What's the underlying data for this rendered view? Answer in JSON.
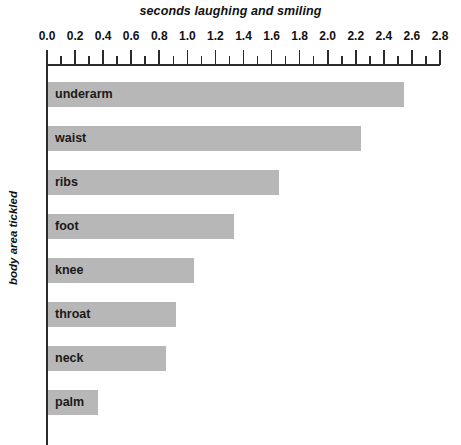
{
  "chart_data": {
    "type": "bar",
    "orientation": "horizontal",
    "title": "seconds laughing and smiling",
    "xlabel": "seconds laughing and smiling",
    "ylabel": "body area tickled",
    "categories": [
      "underarm",
      "waist",
      "ribs",
      "foot",
      "knee",
      "throat",
      "neck",
      "palm"
    ],
    "values": [
      2.54,
      2.24,
      1.65,
      1.33,
      1.05,
      0.92,
      0.85,
      0.36
    ],
    "xlim": [
      0.0,
      2.8
    ],
    "xticks": [
      0.0,
      0.2,
      0.4,
      0.6,
      0.8,
      1.0,
      1.2,
      1.4,
      1.6,
      1.8,
      2.0,
      2.2,
      2.4,
      2.6,
      2.8
    ],
    "xtick_labels": [
      "0.0",
      "0.2",
      "0.4",
      "0.6",
      "0.8",
      "1.0",
      "1.2",
      "1.4",
      "1.6",
      "1.8",
      "2.0",
      "2.2",
      "2.4",
      "2.6",
      "2.8"
    ],
    "minor_tick_step": 0.1,
    "grid": false,
    "legend": null,
    "bar_color": "#b7b7b7",
    "axis_color": "#2b2b2b",
    "text_color": "#1a1a1a"
  }
}
